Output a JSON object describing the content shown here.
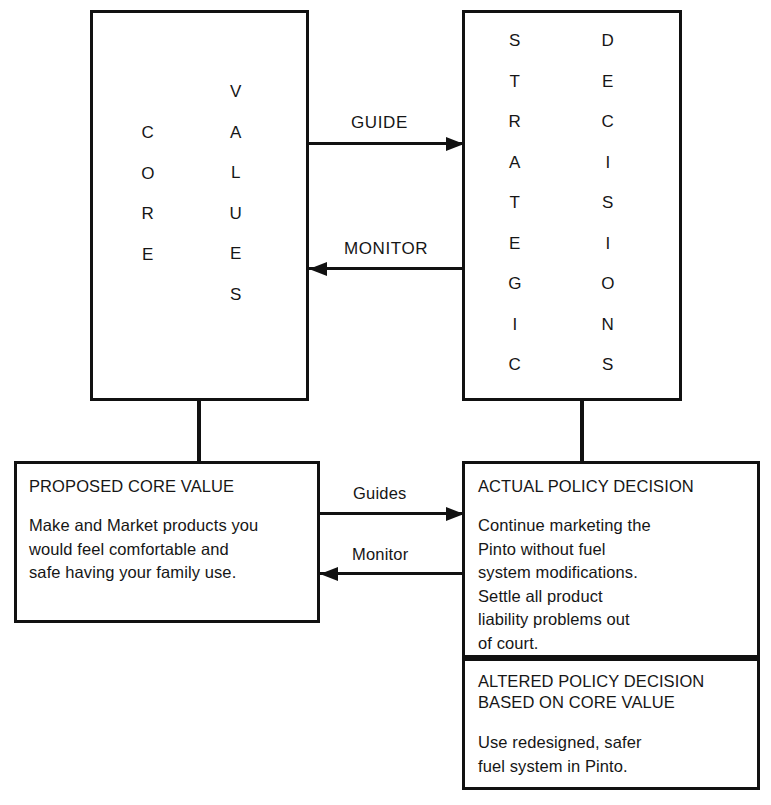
{
  "diagram": {
    "title_hidden": "Core Values and Strategic Decisions feedback loop",
    "top_left_box": {
      "column_1_letters": [
        "C",
        "O",
        "R",
        "E"
      ],
      "column_1_word": "CORE",
      "column_2_letters": [
        "V",
        "A",
        "L",
        "U",
        "E",
        "S"
      ],
      "column_2_word": "VALUES"
    },
    "top_right_box": {
      "column_1_letters": [
        "S",
        "T",
        "R",
        "A",
        "T",
        "E",
        "G",
        "I",
        "C"
      ],
      "column_1_word": "STRATEGIC",
      "column_2_letters": [
        "D",
        "E",
        "C",
        "I",
        "S",
        "I",
        "O",
        "N",
        "S"
      ],
      "column_2_word": "DECISIONS"
    },
    "top_arrows": {
      "forward_label": "GUIDE",
      "backward_label": "MONITOR"
    },
    "bottom_arrows": {
      "forward_label": "Guides",
      "backward_label": "Monitor"
    },
    "bottom_left_box": {
      "title": "PROPOSED CORE VALUE",
      "body": "Make and Market products you\nwould feel comfortable and\nsafe having your family use."
    },
    "bottom_right_box": {
      "section_1": {
        "title": "ACTUAL POLICY DECISION",
        "body": "Continue marketing the\nPinto without fuel\nsystem modifications.\nSettle all product\nliability problems out\nof court."
      },
      "section_2": {
        "title": "ALTERED POLICY DECISION\nBASED ON CORE VALUE",
        "body": "Use redesigned, safer\nfuel system in Pinto."
      }
    },
    "colors": {
      "stroke": "#111111",
      "text": "#161616",
      "background": "#ffffff"
    }
  }
}
